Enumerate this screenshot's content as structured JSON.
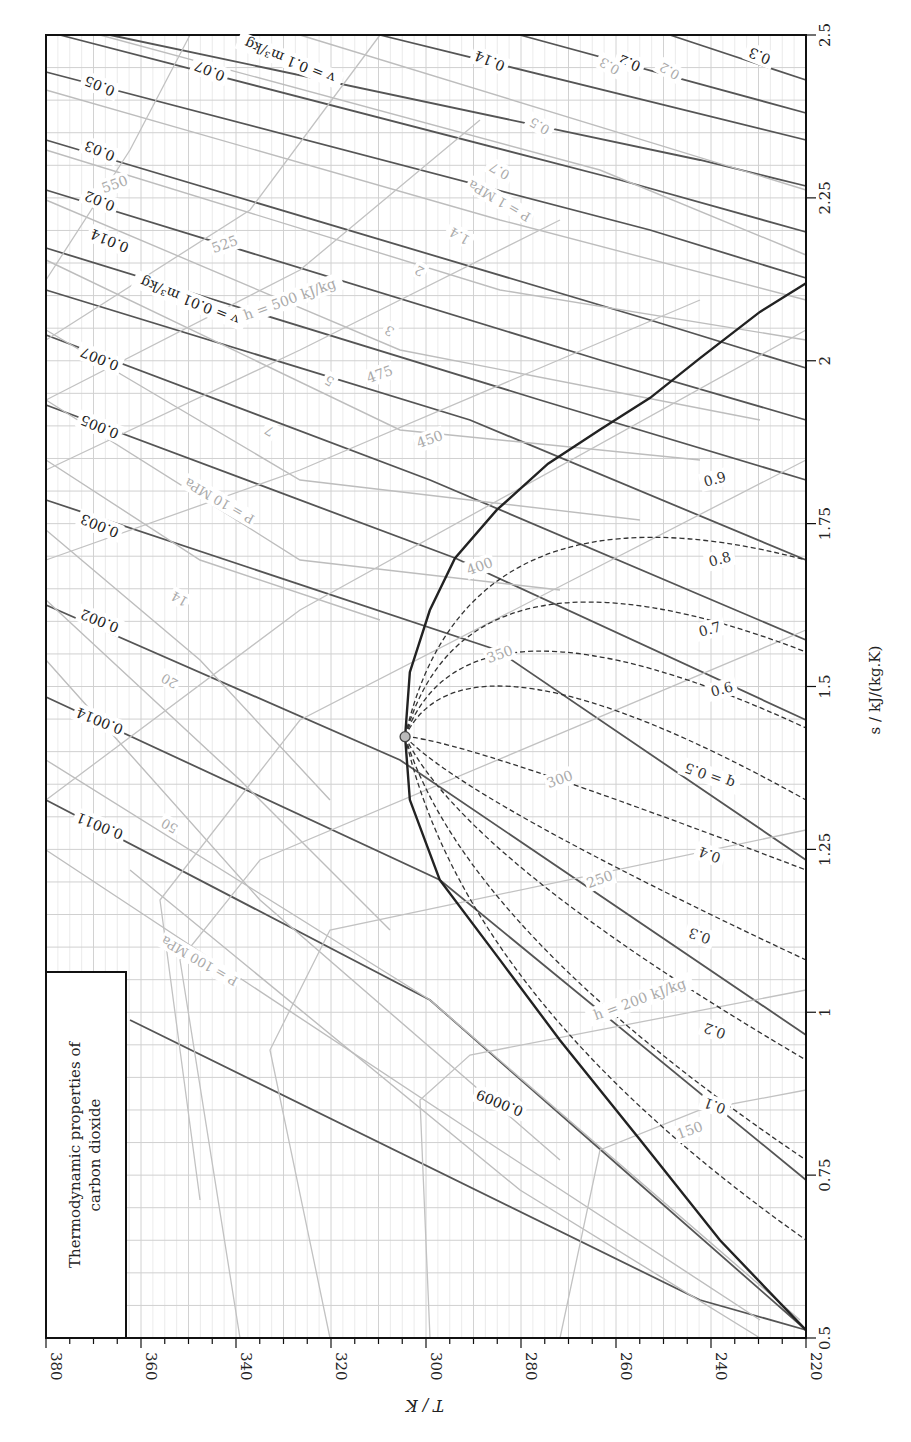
{
  "chart_data": {
    "type": "line",
    "title": "Thermodynamic properties of carbon dioxide",
    "xlabel": "T / K",
    "ylabel": "s / kJ/(kg.K)",
    "orientation": "rotated 90° (T axis along bottom reading right-to-left, s axis along right side)",
    "xlim": [
      380,
      220
    ],
    "ylim": [
      0.5,
      2.5
    ],
    "grid": true,
    "t_ticks": [
      "380",
      "360",
      "340",
      "320",
      "300",
      "280",
      "260",
      "240",
      "220"
    ],
    "s_ticks": [
      "0.5",
      "0.75",
      "1",
      "1.25",
      "1.5",
      "1.75",
      "2",
      "2.25",
      "2.5"
    ],
    "critical_point": {
      "T": 304.4,
      "s": 1.423
    },
    "saturation_dome": {
      "vapor": [
        [
          304.4,
          1.423
        ],
        [
          303.4,
          1.522
        ],
        [
          299.2,
          1.617
        ],
        [
          293.9,
          1.697
        ],
        [
          285.1,
          1.771
        ],
        [
          274.3,
          1.842
        ],
        [
          263.4,
          1.894
        ],
        [
          252.8,
          1.943
        ],
        [
          242.3,
          2.004
        ],
        [
          229.7,
          2.075
        ],
        [
          220,
          2.119
        ]
      ],
      "liquid": [
        [
          304.4,
          1.423
        ],
        [
          303.4,
          1.326
        ],
        [
          297.1,
          1.203
        ],
        [
          284.4,
          1.08
        ],
        [
          271.8,
          0.957
        ],
        [
          254.9,
          0.804
        ],
        [
          238.1,
          0.65
        ],
        [
          220,
          0.512
        ]
      ]
    },
    "quality_lines": {
      "label_prefix": "q = ",
      "values": [
        "0.1",
        "0.2",
        "0.3",
        "0.4",
        "0.5",
        "0.6",
        "0.7",
        "0.8",
        "0.9"
      ]
    },
    "specific_volume_lines": {
      "unit": "m³/kg",
      "labels": [
        "0.0009",
        "0.0011",
        "0.0014",
        "0.002",
        "0.003",
        "0.005",
        "0.007",
        "v = 0.01 m³/kg",
        "0.014",
        "0.02",
        "0.03",
        "0.05",
        "0.07",
        "v = 0.1 m³/kg",
        "0.14",
        "0.2",
        "0.3"
      ]
    },
    "pressure_lines": {
      "unit": "MPa",
      "labels": [
        "P = 100 MPa",
        "50",
        "20",
        "14",
        "P = 10 MPa",
        "7",
        "5",
        "3",
        "2",
        "1.4",
        "P = 1 MPa",
        "0.7",
        "0.5",
        "0.3",
        "0.2"
      ]
    },
    "enthalpy_lines": {
      "unit": "kJ/kg",
      "labels": [
        "150",
        "h = 200 kJ/kg",
        "250",
        "300",
        "350",
        "400",
        "450",
        "475",
        "h = 500 kJ/kg",
        "525",
        "550"
      ]
    }
  },
  "labels": {
    "title_line1": "Thermodynamic properties of",
    "title_line2": "carbon dioxide",
    "t_axis": "T / K",
    "s_axis": "s / kJ/(kg.K)"
  }
}
